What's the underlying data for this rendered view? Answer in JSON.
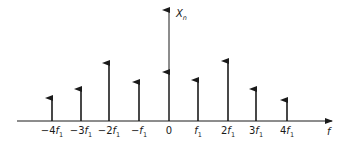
{
  "diagram": {
    "y_axis_label": "X",
    "y_axis_subscript": "n",
    "x_axis_label": "f",
    "colors": {
      "ink": "#1a1a1a",
      "background": "#ffffff"
    }
  },
  "chart_data": {
    "type": "stem",
    "xlabel": "f",
    "ylabel": "X_n",
    "categories": [
      "-4f1",
      "-3f1",
      "-2f1",
      "-f1",
      "0",
      "f1",
      "2f1",
      "3f1",
      "4f1"
    ],
    "tick_labels": [
      {
        "pre": "−4",
        "main": "f",
        "sub": "1"
      },
      {
        "pre": "−3",
        "main": "f",
        "sub": "1"
      },
      {
        "pre": "−2",
        "main": "f",
        "sub": "1"
      },
      {
        "pre": "−",
        "main": "f",
        "sub": "1"
      },
      {
        "pre": "",
        "main": "0",
        "sub": ""
      },
      {
        "pre": "",
        "main": "f",
        "sub": "1"
      },
      {
        "pre": "2",
        "main": "f",
        "sub": "1"
      },
      {
        "pre": "3",
        "main": "f",
        "sub": "1"
      },
      {
        "pre": "4",
        "main": "f",
        "sub": "1"
      }
    ],
    "values": [
      23,
      32,
      58,
      39,
      49,
      41,
      60,
      32,
      21
    ],
    "grid": false,
    "legend": "none"
  }
}
